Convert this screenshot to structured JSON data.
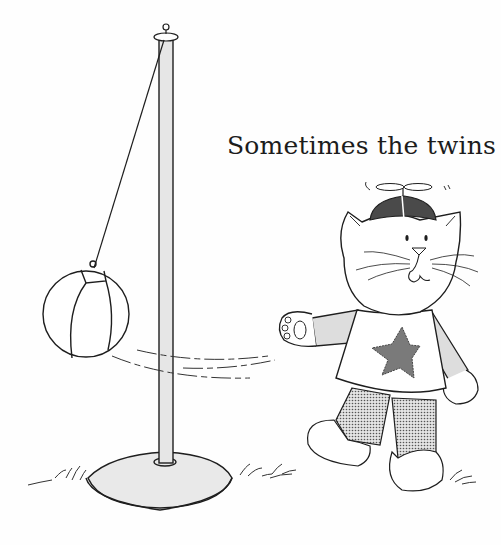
{
  "caption": {
    "text": "Sometimes the twins"
  },
  "illustration": {
    "subject": "cat wearing propeller beanie and star shirt hitting a tetherball",
    "elements": [
      "tetherball-pole",
      "tetherball",
      "tether-rope",
      "pole-base",
      "cat",
      "propeller-beanie",
      "star-shirt",
      "dotted-pants",
      "grass-tufts",
      "motion-lines"
    ],
    "colors": {
      "ink": "#1e1e1e",
      "pole_fill": "#e6e6e6",
      "base_fill": "#e9e9e9",
      "sleeve_fill": "#dddddd",
      "star_fill": "#7a7a7a",
      "cap_fill": "#4a4a4a",
      "pants_fill": "#bdbdbd",
      "background": "#fefefe"
    }
  }
}
